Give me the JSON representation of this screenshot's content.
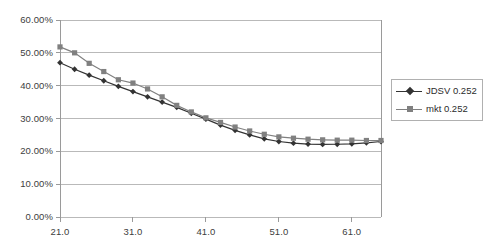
{
  "chart_data": {
    "type": "line",
    "title": "",
    "subtitle": "",
    "xlabel": "",
    "ylabel": "",
    "xlim": [
      21,
      65
    ],
    "ylim": [
      0,
      0.6
    ],
    "grid": true,
    "grid_axis": "y",
    "legend_position": "right",
    "x_tick_labels": [
      "21.0",
      "31.0",
      "41.0",
      "51.0",
      "61.0"
    ],
    "x_tick_values": [
      21,
      31,
      41,
      51,
      61
    ],
    "y_tick_labels": [
      "0.00%",
      "10.00%",
      "20.00%",
      "30.00%",
      "40.00%",
      "50.00%",
      "60.00%"
    ],
    "y_tick_values": [
      0,
      0.1,
      0.2,
      0.3,
      0.4,
      0.5,
      0.6
    ],
    "x": [
      21,
      23,
      25,
      27,
      29,
      31,
      33,
      35,
      37,
      39,
      41,
      43,
      45,
      47,
      49,
      51,
      53,
      55,
      57,
      59,
      61,
      63,
      65
    ],
    "series": [
      {
        "name": "JDSV 0.252",
        "color": "#333333",
        "marker": "diamond",
        "values": [
          0.47,
          0.45,
          0.432,
          0.415,
          0.398,
          0.382,
          0.366,
          0.35,
          0.334,
          0.316,
          0.298,
          0.28,
          0.264,
          0.25,
          0.238,
          0.23,
          0.225,
          0.222,
          0.221,
          0.2215,
          0.223,
          0.226,
          0.23
        ]
      },
      {
        "name": "mkt 0.252",
        "color": "#808080",
        "marker": "square",
        "values": [
          0.518,
          0.5,
          0.468,
          0.443,
          0.418,
          0.408,
          0.39,
          0.366,
          0.34,
          0.32,
          0.302,
          0.288,
          0.274,
          0.262,
          0.252,
          0.244,
          0.24,
          0.237,
          0.235,
          0.234,
          0.234,
          0.233,
          0.233
        ]
      }
    ]
  },
  "legend": {
    "items": [
      {
        "label": "JDSV 0.252"
      },
      {
        "label": "mkt 0.252"
      }
    ]
  }
}
